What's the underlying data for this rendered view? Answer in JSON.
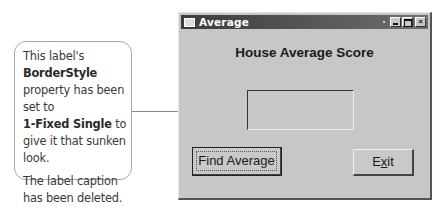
{
  "callout": {
    "para1_part1": "This label's",
    "para1_bold1": "BorderStyle",
    "para1_part2": " property has been set to",
    "para1_bold2": "1-Fixed Single",
    "para1_part3": " to give it that sunken look.",
    "para2": "The label caption has been deleted."
  },
  "window": {
    "title": "Average",
    "titlebar_icon": "form-icon",
    "controls": [
      "minimize",
      "maximize",
      "close"
    ],
    "close_glyph": "×",
    "heading": "House Average Score",
    "output_label_caption": "",
    "buttons": {
      "find_average": "Find Average",
      "exit_pre": "E",
      "exit_accel": "x",
      "exit_post": "it"
    }
  }
}
